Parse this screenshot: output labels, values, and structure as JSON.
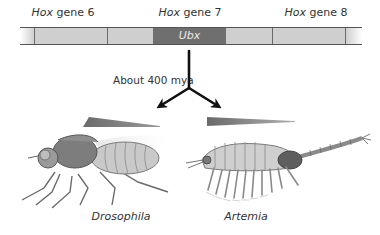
{
  "genes": [
    {
      "prefix": "Hox",
      "suffix": " gene 6",
      "center_x": 63
    },
    {
      "prefix": "Hox",
      "suffix": " gene 7",
      "center_x": 190
    },
    {
      "prefix": "Hox",
      "suffix": " gene 8",
      "center_x": 316
    }
  ],
  "chromosome": {
    "highlighted_gene": "Ubx",
    "colors": {
      "segment": "#cfcfcf",
      "highlight": "#6f6f6f",
      "line": "#555555"
    }
  },
  "divergence": {
    "label": "About 400 mya"
  },
  "species": [
    {
      "name": "Drosophila",
      "center_x": 121
    },
    {
      "name": "Artemia",
      "center_x": 246
    }
  ],
  "colors": {
    "wedge": "#6e6e6e",
    "arrow": "#111111"
  }
}
